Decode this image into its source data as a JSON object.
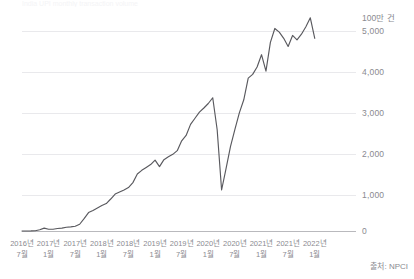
{
  "top_partial_text": "India UPI monthly transaction volume",
  "source_note": "출처: NPCI",
  "y_axis": {
    "unit_label": "100만 건",
    "ticks": [
      "5,000",
      "4,000",
      "3,000",
      "2,000",
      "1,000",
      "0"
    ]
  },
  "x_axis": {
    "labels": [
      {
        "year": "2016년",
        "month": "7월"
      },
      {
        "year": "2017년",
        "month": "1월"
      },
      {
        "year": "2017년",
        "month": "7월"
      },
      {
        "year": "2018년",
        "month": "1월"
      },
      {
        "year": "2018년",
        "month": "7월"
      },
      {
        "year": "2019년",
        "month": "1월"
      },
      {
        "year": "2019년",
        "month": "7월"
      },
      {
        "year": "2020년",
        "month": "1월"
      },
      {
        "year": "2020년",
        "month": "7월"
      },
      {
        "year": "2021년",
        "month": "1월"
      },
      {
        "year": "2021년",
        "month": "7월"
      },
      {
        "year": "2022년",
        "month": "1월"
      }
    ]
  },
  "chart_data": {
    "type": "line",
    "title": "",
    "xlabel": "",
    "ylabel": "100만 건",
    "ylim": [
      0,
      5500
    ],
    "grid": true,
    "legend": false,
    "line_color": "#59595e",
    "x": [
      "2016-07",
      "2016-08",
      "2016-09",
      "2016-10",
      "2016-11",
      "2016-12",
      "2017-01",
      "2017-02",
      "2017-03",
      "2017-04",
      "2017-05",
      "2017-06",
      "2017-07",
      "2017-08",
      "2017-09",
      "2017-10",
      "2017-11",
      "2017-12",
      "2018-01",
      "2018-02",
      "2018-03",
      "2018-04",
      "2018-05",
      "2018-06",
      "2018-07",
      "2018-08",
      "2018-09",
      "2018-10",
      "2018-11",
      "2018-12",
      "2019-01",
      "2019-02",
      "2019-03",
      "2019-04",
      "2019-05",
      "2019-06",
      "2019-07",
      "2019-08",
      "2019-09",
      "2019-10",
      "2019-11",
      "2019-12",
      "2020-01",
      "2020-02",
      "2020-03",
      "2020-04",
      "2020-05",
      "2020-06",
      "2020-07",
      "2020-08",
      "2020-09",
      "2020-10",
      "2020-11",
      "2020-12",
      "2021-01",
      "2021-02",
      "2021-03",
      "2021-04",
      "2021-05",
      "2021-06",
      "2021-07",
      "2021-08",
      "2021-09",
      "2021-10",
      "2021-11",
      "2021-12",
      "2022-01"
    ],
    "values": [
      0.3,
      0.9,
      2,
      7,
      30,
      70,
      42,
      42,
      61,
      70,
      91,
      100,
      115,
      165,
      300,
      450,
      500,
      560,
      620,
      670,
      780,
      900,
      950,
      1000,
      1060,
      1180,
      1390,
      1480,
      1550,
      1620,
      1730,
      1570,
      1740,
      1810,
      1870,
      1960,
      2200,
      2330,
      2600,
      2750,
      2900,
      3000,
      3110,
      3250,
      2470,
      1000,
      1520,
      2060,
      2480,
      2880,
      3200,
      3730,
      3820,
      4000,
      4300,
      3900,
      4600,
      4940,
      4850,
      4700,
      4500,
      4770,
      4660,
      4800,
      4980,
      5200,
      4700
    ],
    "series": [
      {
        "name": "UPI 거래 건수",
        "values": [
          0.3,
          0.9,
          2,
          7,
          30,
          70,
          42,
          42,
          61,
          70,
          91,
          100,
          115,
          165,
          300,
          450,
          500,
          560,
          620,
          670,
          780,
          900,
          950,
          1000,
          1060,
          1180,
          1390,
          1480,
          1550,
          1620,
          1730,
          1570,
          1740,
          1810,
          1870,
          1960,
          2200,
          2330,
          2600,
          2750,
          2900,
          3000,
          3110,
          3250,
          2470,
          1000,
          1520,
          2060,
          2480,
          2880,
          3200,
          3730,
          3820,
          4000,
          4300,
          3900,
          4600,
          4940,
          4850,
          4700,
          4500,
          4770,
          4660,
          4800,
          4980,
          5200,
          4700
        ]
      }
    ],
    "annotations": [
      "2020년 4월 급감 (코로나19)"
    ]
  }
}
